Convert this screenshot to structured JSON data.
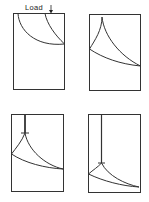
{
  "figure": {
    "load_label": "Load",
    "stroke_color": "#333333",
    "panels": [
      {
        "id": "panel-1",
        "position": "top-left",
        "description": "initial arc-shaped crack fronts under load"
      },
      {
        "id": "panel-2",
        "position": "top-right",
        "description": "cusp-shaped crack fronts meeting at top"
      },
      {
        "id": "panel-3",
        "position": "bottom-left",
        "description": "vertical notch growing from top with crack fronts"
      },
      {
        "id": "panel-4",
        "position": "bottom-right",
        "description": "deep vertical notch with crack fronts near bottom"
      }
    ]
  }
}
